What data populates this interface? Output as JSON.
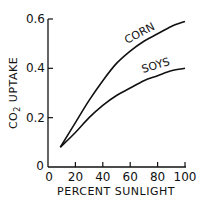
{
  "chart_data": {
    "type": "line",
    "title": "",
    "xlabel": "PERCENT SUNLIGHT",
    "ylabel": "CO2 UPTAKE",
    "ylabel_main": "CO",
    "ylabel_sub": "2",
    "ylabel_rest": " UPTAKE",
    "xlim": [
      0,
      100
    ],
    "ylim": [
      0,
      0.6
    ],
    "grid": false,
    "legend": "inline labels",
    "x_ticks": [
      "0",
      "20",
      "40",
      "60",
      "80",
      "100"
    ],
    "y_ticks": [
      "0",
      "0.2",
      "0.4",
      "0.6"
    ],
    "x": [
      9,
      20,
      30,
      40,
      50,
      60,
      70,
      80,
      90,
      100
    ],
    "series": [
      {
        "name": "CORN",
        "values": [
          0.08,
          0.18,
          0.27,
          0.35,
          0.42,
          0.47,
          0.51,
          0.54,
          0.57,
          0.59
        ]
      },
      {
        "name": "SOYS",
        "values": [
          0.08,
          0.14,
          0.2,
          0.25,
          0.29,
          0.32,
          0.35,
          0.37,
          0.39,
          0.4
        ]
      }
    ]
  }
}
